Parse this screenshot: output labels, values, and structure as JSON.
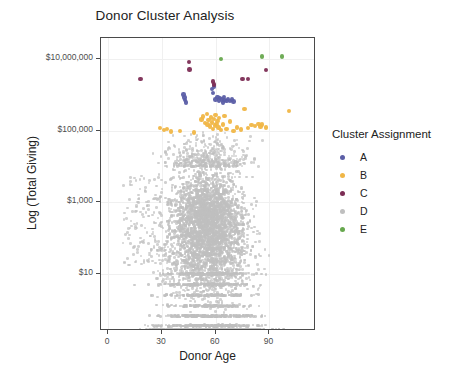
{
  "chart_data": {
    "type": "scatter",
    "title": "Donor Cluster Analysis",
    "xlabel": "Donor Age",
    "ylabel": "Log (Total Giving)",
    "xlim": [
      -4,
      116
    ],
    "ylim_log10": [
      -0.6,
      7.6
    ],
    "grid": true,
    "xticks": [
      0,
      30,
      60,
      90
    ],
    "xtick_labels": [
      "0",
      "30",
      "60",
      "90"
    ],
    "yticks_log10": [
      7,
      5,
      3,
      1
    ],
    "ytick_labels": [
      "$10,000,000",
      "$100,000",
      "$1,000",
      "$10"
    ],
    "legend": {
      "title": "Cluster Assignment",
      "position": "right",
      "entries": [
        {
          "label": "A",
          "color": "#5b5ea6"
        },
        {
          "label": "B",
          "color": "#f0b646"
        },
        {
          "label": "C",
          "color": "#7c2d55"
        },
        {
          "label": "D",
          "color": "#bfbfbf"
        },
        {
          "label": "E",
          "color": "#67a84e"
        }
      ]
    },
    "series": [
      {
        "name": "A",
        "color": "#5b5ea6",
        "points": [
          [
            42,
            6.02
          ],
          [
            42.5,
            5.93
          ],
          [
            43,
            5.86
          ],
          [
            43.5,
            5.8
          ],
          [
            58,
            6.18
          ],
          [
            58.5,
            6.06
          ],
          [
            60,
            5.88
          ],
          [
            61,
            5.95
          ],
          [
            62,
            5.85
          ],
          [
            62.5,
            5.92
          ],
          [
            63.5,
            5.88
          ],
          [
            64,
            5.8
          ],
          [
            65,
            5.86
          ],
          [
            66,
            5.83
          ],
          [
            67,
            5.9
          ],
          [
            68,
            5.84
          ],
          [
            69,
            5.88
          ],
          [
            70,
            5.82
          ],
          [
            59,
            6.24
          ],
          [
            64.5,
            5.95
          ]
        ]
      },
      {
        "name": "B",
        "color": "#f0b646",
        "points": [
          [
            29,
            5.08
          ],
          [
            31,
            5.02
          ],
          [
            33,
            5.05
          ],
          [
            35,
            4.98
          ],
          [
            40,
            5.0
          ],
          [
            52,
            5.32
          ],
          [
            53,
            5.4
          ],
          [
            54,
            5.22
          ],
          [
            55,
            5.48
          ],
          [
            55.5,
            5.18
          ],
          [
            56,
            5.3
          ],
          [
            57,
            5.12
          ],
          [
            57.5,
            5.38
          ],
          [
            58,
            5.24
          ],
          [
            58.5,
            5.05
          ],
          [
            59,
            5.34
          ],
          [
            59.5,
            5.15
          ],
          [
            60,
            5.44
          ],
          [
            60.5,
            5.2
          ],
          [
            61,
            5.28
          ],
          [
            61.5,
            5.1
          ],
          [
            62,
            5.36
          ],
          [
            63,
            5.02
          ],
          [
            64,
            5.18
          ],
          [
            65,
            5.42
          ],
          [
            66,
            5.06
          ],
          [
            68,
            5.26
          ],
          [
            70,
            5.0
          ],
          [
            72,
            5.1
          ],
          [
            74,
            5.04
          ],
          [
            76,
            5.62
          ],
          [
            78,
            5.08
          ],
          [
            80,
            5.16
          ],
          [
            82,
            5.14
          ],
          [
            84,
            5.2
          ],
          [
            85,
            5.12
          ],
          [
            86,
            5.18
          ],
          [
            88,
            5.1
          ],
          [
            101,
            5.56
          ],
          [
            48,
            4.96
          ]
        ]
      },
      {
        "name": "C",
        "color": "#7c2d55",
        "points": [
          [
            18,
            6.46
          ],
          [
            45,
            6.92
          ],
          [
            45.5,
            6.72
          ],
          [
            58.5,
            6.38
          ],
          [
            59,
            6.3
          ],
          [
            75,
            6.46
          ],
          [
            78,
            6.46
          ],
          [
            88,
            6.7
          ]
        ]
      },
      {
        "name": "D",
        "color": "#bfbfbf",
        "description": "Large dense cloud of ~thousands of ordinary donors spanning ages ~3 to 110 and gifts from under $10 up to about $50,000, with discrete horizontal bands at low dollar values.",
        "approx_count": 9000
      },
      {
        "name": "E",
        "color": "#67a84e",
        "points": [
          [
            63,
            7.02
          ],
          [
            86,
            7.08
          ],
          [
            97,
            7.08
          ]
        ]
      }
    ]
  }
}
